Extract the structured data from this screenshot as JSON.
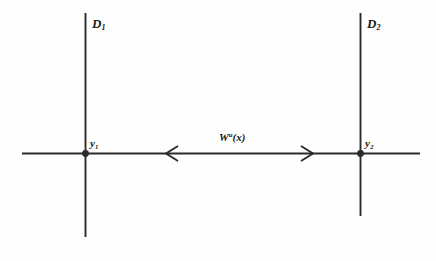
{
  "figure": {
    "background_color": "#fefefe",
    "ink_color": "#2b2b2b",
    "width": 436,
    "height": 261
  },
  "labels": {
    "d1": {
      "base": "D",
      "sub": "1"
    },
    "d2": {
      "base": "D",
      "sub": "2"
    },
    "y1": {
      "base": "y",
      "sub": "1"
    },
    "y2": {
      "base": "y",
      "sub": "2"
    },
    "manifold": {
      "base": "W",
      "sup": "u",
      "arg": "(x)"
    }
  },
  "geometry": {
    "horizontal_line": {
      "x1": 22,
      "x2": 420,
      "y": 153
    },
    "vertical_line_1": {
      "x": 85,
      "y1": 13,
      "y2": 237
    },
    "vertical_line_2": {
      "x": 360,
      "y1": 13,
      "y2": 216
    },
    "point_y1": {
      "cx": 85,
      "cy": 153,
      "r": 3.4
    },
    "point_y2": {
      "cx": 360,
      "cy": 153,
      "r": 3.4
    },
    "arrow_left": {
      "tip_x": 166,
      "y": 153,
      "direction": "left"
    },
    "arrow_right": {
      "tip_x": 313,
      "y": 153,
      "direction": "right"
    }
  }
}
